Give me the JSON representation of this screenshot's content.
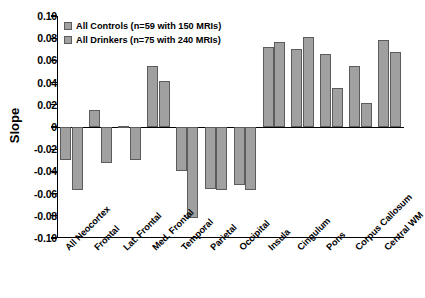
{
  "chart_data": {
    "type": "bar",
    "title": "",
    "xlabel": "",
    "ylabel": "Slope",
    "ylim": [
      -0.1,
      0.1
    ],
    "ytick_values": [
      0.1,
      0.08,
      0.06,
      0.04,
      0.02,
      0,
      -0.02,
      -0.04,
      -0.06,
      -0.08,
      -0.1
    ],
    "ytick_labels": [
      "0.10",
      "0.08",
      "0.06",
      "0.04",
      "0.02",
      "0",
      "-0.02",
      "-0.04",
      "-0.06",
      "-0.08",
      "-0.10"
    ],
    "grid": false,
    "legend_position": "top-left",
    "categories": [
      "All Neocortex",
      "Frontal",
      "Lat. Frontal",
      "Med. Frontal",
      "Temporal",
      "Parietal",
      "Occipital",
      "Insula",
      "Cingulum",
      "Pons",
      "Corpus Callosum",
      "Central WM"
    ],
    "series": [
      {
        "name": "All Controls (n=59 with 150 MRIs)",
        "color": "#a0a0a0",
        "values": [
          -0.03,
          0.015,
          0.001,
          0.055,
          -0.04,
          -0.056,
          -0.052,
          0.072,
          0.07,
          0.066,
          0.055,
          0.078
        ]
      },
      {
        "name": "All Drinkers (n=75 with 240 MRIs)",
        "color": "#a0a0a0",
        "values": [
          -0.057,
          -0.032,
          -0.03,
          0.041,
          -0.082,
          -0.057,
          -0.057,
          0.077,
          0.081,
          0.035,
          0.022,
          0.068
        ]
      }
    ]
  },
  "legend": {
    "items": [
      {
        "label": "All Controls (n=59 with 150 MRIs)"
      },
      {
        "label": "All Drinkers (n=75 with 240 MRIs)"
      }
    ]
  }
}
